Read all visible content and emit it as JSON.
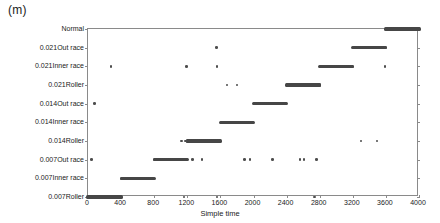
{
  "panel": {
    "title": "(m)"
  },
  "axes": {
    "x_title": "Simple time",
    "x_ticks": [
      0,
      400,
      800,
      1200,
      1600,
      2000,
      2400,
      2800,
      3200,
      3600,
      4000
    ],
    "x_min": 0,
    "x_max": 4000,
    "y_categories": [
      "Normal",
      "0.021Out race",
      "0.021Inner race",
      "0.021Roller",
      "0.014Out race",
      "0.014Inner race",
      "0.014Roller",
      "0.007Out race",
      "0.007Inner race",
      "0.007Roller"
    ]
  },
  "style": {
    "point_color": "#4d4d4d",
    "axis_color": "#8a8a8a",
    "text_color": "#1a1a1a",
    "background": "#ffffff"
  },
  "chart_data": {
    "type": "scatter",
    "title": "(m)",
    "xlabel": "Simple time",
    "ylabel": "",
    "xlim": [
      0,
      4000
    ],
    "grid": false,
    "legend": null,
    "categories": [
      "0.007Roller",
      "0.007Inner race",
      "0.007Out race",
      "0.014Roller",
      "0.014Inner race",
      "0.014Out race",
      "0.021Roller",
      "0.021Inner race",
      "0.021Out race",
      "Normal"
    ],
    "series": [
      {
        "name": "Normal",
        "row": 0,
        "band": [
          3600,
          4000
        ],
        "outliers": []
      },
      {
        "name": "0.021Out race",
        "row": 1,
        "band": [
          3200,
          3600
        ],
        "outliers": [
          1550
        ]
      },
      {
        "name": "0.021Inner race",
        "row": 2,
        "band": [
          2800,
          3200
        ],
        "outliers": [
          280,
          1190,
          1560,
          3590
        ]
      },
      {
        "name": "0.021Roller",
        "row": 3,
        "band": [
          2400,
          2800
        ],
        "outliers": [
          1680,
          1800
        ]
      },
      {
        "name": "0.014Out race",
        "row": 4,
        "band": [
          2000,
          2400
        ],
        "outliers": [
          80
        ]
      },
      {
        "name": "0.014Inner race",
        "row": 5,
        "band": [
          1600,
          2000
        ],
        "outliers": []
      },
      {
        "name": "0.014Roller",
        "row": 6,
        "band": [
          1200,
          1600
        ],
        "outliers": [
          1130,
          1175,
          3300,
          3490
        ]
      },
      {
        "name": "0.007Out race",
        "row": 7,
        "band": [
          800,
          1200
        ],
        "outliers": [
          40,
          1260,
          1380,
          1890,
          1960,
          2230,
          2560,
          2610,
          2760
        ]
      },
      {
        "name": "0.007Inner race",
        "row": 8,
        "band": [
          400,
          800
        ],
        "outliers": []
      },
      {
        "name": "0.007Roller",
        "row": 9,
        "band": [
          0,
          400
        ],
        "outliers": [
          1160,
          1560,
          2740
        ]
      }
    ]
  }
}
